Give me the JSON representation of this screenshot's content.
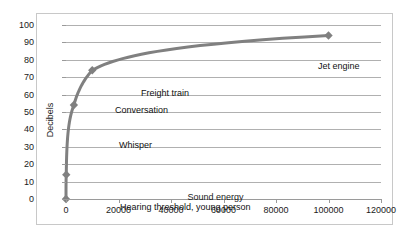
{
  "chart_data": {
    "type": "line",
    "title": "",
    "xlabel": "Sound energy",
    "ylabel": "Decibels",
    "xlim": [
      0,
      120000
    ],
    "ylim": [
      0,
      100
    ],
    "grid": true,
    "legend": "none",
    "marker": "diamond",
    "series_color": "#808080",
    "gridline_color": "#b0b0b0",
    "x": [
      0,
      100,
      3000,
      10000,
      100000
    ],
    "values": [
      0,
      14,
      54,
      74,
      94
    ],
    "xticks": [
      0,
      20000,
      40000,
      60000,
      80000,
      100000,
      120000
    ],
    "xtick_labels": [
      "0",
      "20000",
      "40000",
      "60000",
      "80000",
      "100000",
      "120000"
    ],
    "yticks": [
      0,
      10,
      20,
      30,
      40,
      50,
      60,
      70,
      80,
      90,
      100
    ],
    "ytick_labels": [
      "0",
      "10",
      "20",
      "30",
      "40",
      "50",
      "60",
      "70",
      "80",
      "90",
      "100"
    ],
    "points": [
      {
        "label": "Hearing threshold, young person",
        "x": 0,
        "y": 0
      },
      {
        "label": "Whisper",
        "x": 100,
        "y": 14
      },
      {
        "label": "Conversation",
        "x": 3000,
        "y": 54
      },
      {
        "label": "Freight train",
        "x": 10000,
        "y": 74
      },
      {
        "label": "Jet engine",
        "x": 100000,
        "y": 94
      }
    ],
    "annotations": [
      {
        "text": "Jet engine",
        "x_px": 281,
        "y_px": 47
      },
      {
        "text": "Freight train",
        "x_px": 104,
        "y_px": 74
      },
      {
        "text": "Conversation",
        "x_px": 78,
        "y_px": 91
      },
      {
        "text": "Whisper",
        "x_px": 82,
        "y_px": 126
      },
      {
        "text": "Hearing threshold, young person",
        "x_px": 83,
        "y_px": 188
      }
    ]
  }
}
